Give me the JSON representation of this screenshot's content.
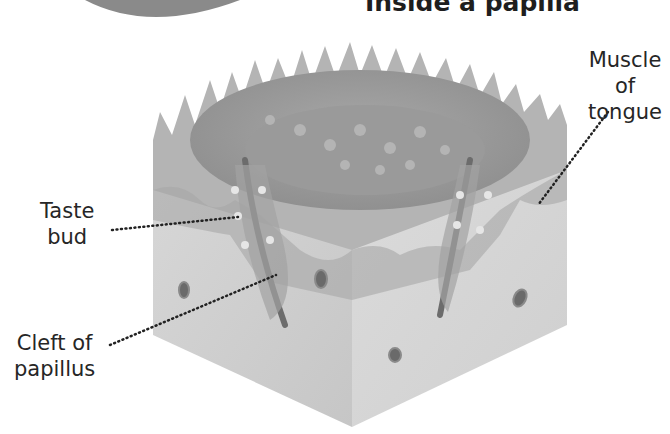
{
  "title": "Inside a papilla",
  "labels": {
    "muscle": [
      "Muscle of",
      "tongue"
    ],
    "taste_bud": [
      "Taste",
      "bud"
    ],
    "cleft": [
      "Cleft of",
      "papillus"
    ]
  },
  "colors": {
    "background": "#ffffff",
    "tissue_light": "#d6d6d6",
    "tissue_mid": "#b8b8b8",
    "tissue_dark": "#9c9c9c",
    "text": "#262626",
    "leader": "#222222"
  }
}
